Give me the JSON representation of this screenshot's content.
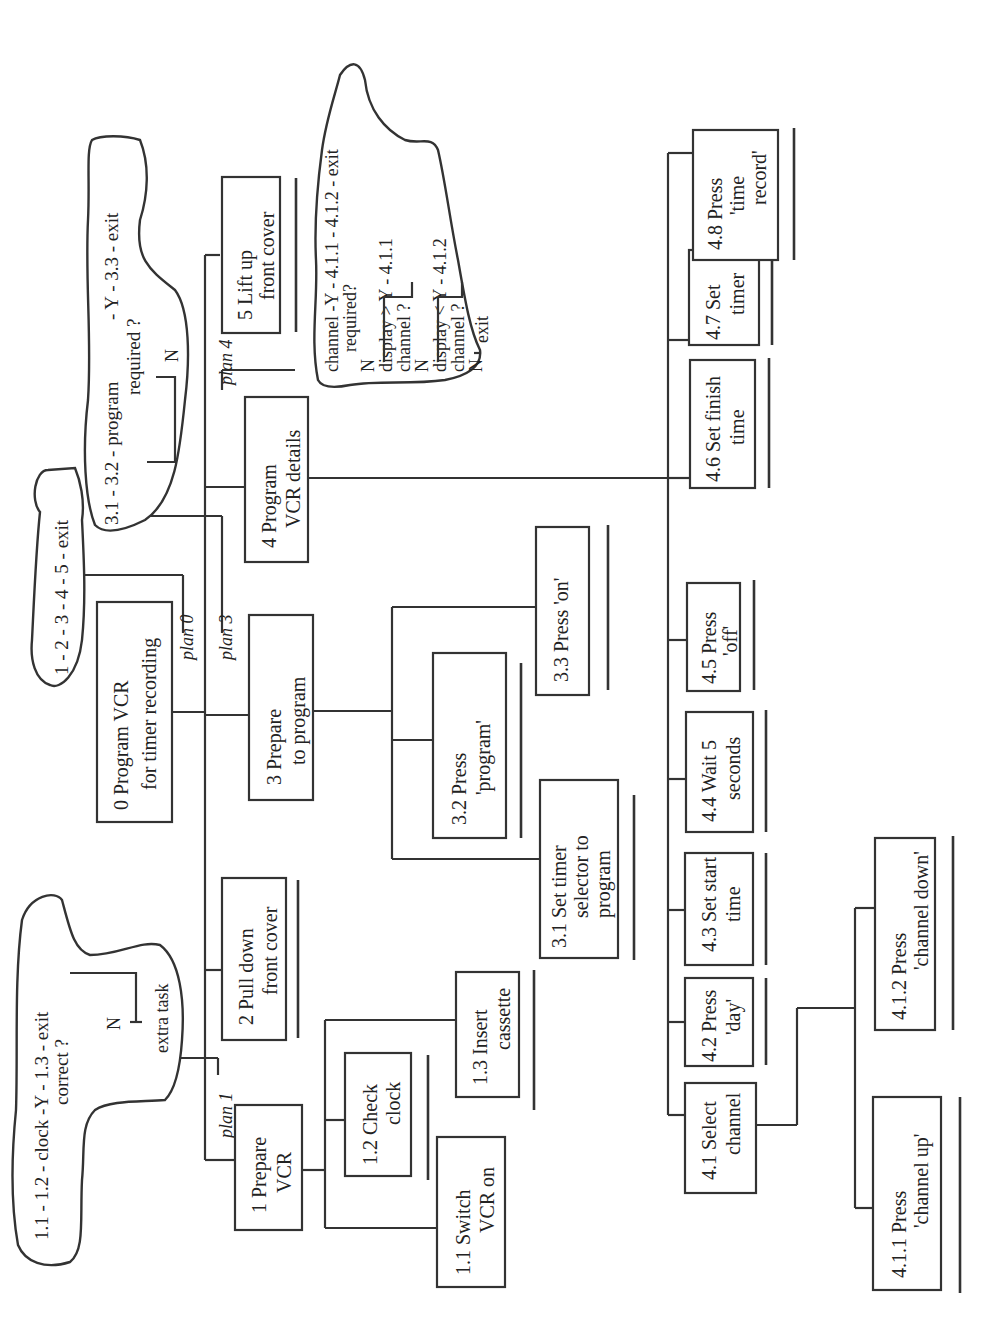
{
  "diagram": {
    "type": "hierarchical-task-analysis",
    "orientation": "rotated-90-ccw",
    "root": {
      "id": "0",
      "label_line1": "0  Program VCR",
      "label_line2": "for timer recording"
    },
    "plans": {
      "plan0": {
        "label": "plan 0",
        "text": "1 - 2 - 3 - 4 - 5 - exit"
      },
      "plan1": {
        "label": "plan 1",
        "line1": "1.1 - 1.2 - clock  -Y - 1.3 - exit",
        "line2": "correct ?",
        "n": "N",
        "extra": "extra task"
      },
      "plan3": {
        "label": "plan 3",
        "line1": "3.1 - 3.2 - program",
        "line2": "required ?",
        "line3": "- Y - 3.3 - exit",
        "n": "N"
      },
      "plan4": {
        "label": "plan 4",
        "line1": "channel -Y - 4.1.1 - 4.1.2 - exit",
        "line2": "required?",
        "line3": "N",
        "line4": "display > Y - 4.1.1",
        "line5": "channel ?",
        "line6": "N",
        "line7": "display < Y - 4.1.2",
        "line8": "channel ?",
        "line9": "N",
        "exit": "exit"
      }
    },
    "level1": [
      {
        "id": "1",
        "line1": "1  Prepare",
        "line2": "VCR"
      },
      {
        "id": "2",
        "line1": "2  Pull down",
        "line2": "front cover"
      },
      {
        "id": "3",
        "line1": "3  Prepare",
        "line2": "to program"
      },
      {
        "id": "4",
        "line1": "4  Program",
        "line2": "VCR details"
      },
      {
        "id": "5",
        "line1": "5  Lift up",
        "line2": "front cover"
      }
    ],
    "task1_children": [
      {
        "id": "1.1",
        "line1": "1.1  Switch",
        "line2": "VCR on"
      },
      {
        "id": "1.2",
        "line1": "1.2  Check",
        "line2": "clock"
      },
      {
        "id": "1.3",
        "line1": "1.3  Insert",
        "line2": "cassette"
      }
    ],
    "task3_children": [
      {
        "id": "3.1",
        "line1": "3.1  Set timer",
        "line2": "selector to",
        "line3": "program"
      },
      {
        "id": "3.2",
        "line1": "3.2  Press",
        "line2": "'program'"
      },
      {
        "id": "3.3",
        "line1": "3.3  Press 'on'"
      }
    ],
    "task4_children": [
      {
        "id": "4.1",
        "line1": "4.1 Select",
        "line2": "channel"
      },
      {
        "id": "4.2",
        "line1": "4.2 Press",
        "line2": "'day'"
      },
      {
        "id": "4.3",
        "line1": "4.3 Set start",
        "line2": "time"
      },
      {
        "id": "4.4",
        "line1": "4.4 Wait 5",
        "line2": "seconds"
      },
      {
        "id": "4.5",
        "line1": "4.5 Press",
        "line2": "'off'"
      },
      {
        "id": "4.6",
        "line1": "4.6 Set finish",
        "line2": "time"
      },
      {
        "id": "4.7",
        "line1": "4.7 Set",
        "line2": "timer"
      },
      {
        "id": "4.8",
        "line1": "4.8 Press",
        "line2": "'time",
        "line3": "record'"
      }
    ],
    "task41_children": [
      {
        "id": "4.1.1",
        "line1": "4.1.1 Press",
        "line2": "'channel up'"
      },
      {
        "id": "4.1.2",
        "line1": "4.1.2 Press",
        "line2": "'channel down'"
      }
    ]
  }
}
